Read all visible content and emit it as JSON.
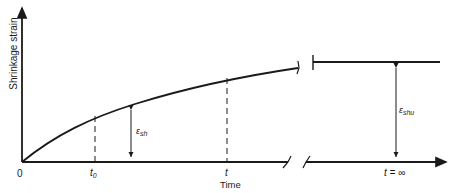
{
  "diagram": {
    "y_axis_label": "Shrinkage strain",
    "x_axis_label": "Time",
    "ticks": {
      "origin": "0",
      "t0_main": "t",
      "t0_sub": "0",
      "t": "t",
      "t_inf": "t = ∞"
    },
    "annotations": {
      "eps_sh_symbol": "ε",
      "eps_sh_sub": "sh",
      "eps_shu_symbol": "ε",
      "eps_shu_sub": "shu"
    },
    "colors": {
      "line": "#1a1a1a",
      "background": "#ffffff"
    }
  }
}
